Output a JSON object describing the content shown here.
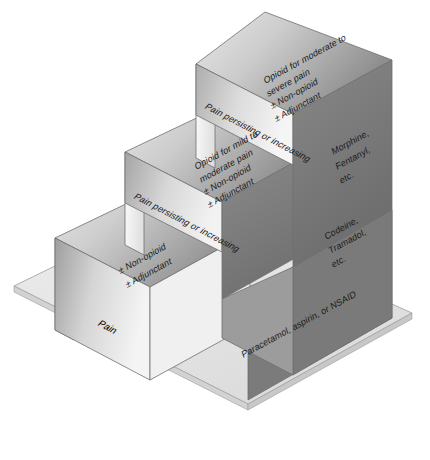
{
  "figure": {
    "background_color": "#ffffff",
    "base_plate_color": "#e6e6e6",
    "step_top_light": "#d9d9d9",
    "step_top_dark": "#8f8f8f",
    "step_front_light": "#f2f2f2",
    "step_front_dark": "#9a9a9a",
    "step_right_color": "#7d7d7d",
    "outline_color": "#555555"
  },
  "steps": [
    {
      "index": 1,
      "name": "step-one",
      "top_label_lines": [
        "± Non-opioid",
        "± Adjunctant"
      ],
      "riser_label": "Pain",
      "side_label_lines": [
        "Paracetamol, aspirin, or NSAID"
      ]
    },
    {
      "index": 2,
      "name": "step-two",
      "top_label_lines": [
        "Opioid for mild to",
        "moderate pain",
        "± Non-opioid",
        "± Adjunctant"
      ],
      "riser_label": "Pain persisting or increasing",
      "side_label_lines": [
        "Codeine,",
        "Tramadol,",
        "etc."
      ]
    },
    {
      "index": 3,
      "name": "step-three",
      "top_label_lines": [
        "Opioid for moderate to",
        "severe pain",
        "± Non-opioid",
        "± Adjunctant"
      ],
      "riser_label": "Pain persisting or increasing",
      "side_label_lines": [
        "Morphine,",
        "Fentanyl,",
        "etc."
      ]
    }
  ],
  "labels": {
    "step1_top_line1": "± Non-opioid",
    "step1_top_line2": "± Adjunctant",
    "step1_riser": "Pain",
    "step1_side": "Paracetamol, aspirin, or NSAID",
    "step2_top_line1": "Opioid for mild to",
    "step2_top_line2": "moderate pain",
    "step2_top_line3": "± Non-opioid",
    "step2_top_line4": "± Adjunctant",
    "step2_riser": "Pain persisting or increasing",
    "step2_side_line1": "Codeine,",
    "step2_side_line2": "Tramadol,",
    "step2_side_line3": "etc.",
    "step3_top_line1": "Opioid for moderate to",
    "step3_top_line2": "severe pain",
    "step3_top_line3": "± Non-opioid",
    "step3_top_line4": "± Adjunctant",
    "step3_riser": "Pain persisting or increasing",
    "step3_side_line1": "Morphine,",
    "step3_side_line2": "Fentanyl,",
    "step3_side_line3": "etc."
  },
  "caption": {
    "text": ""
  }
}
